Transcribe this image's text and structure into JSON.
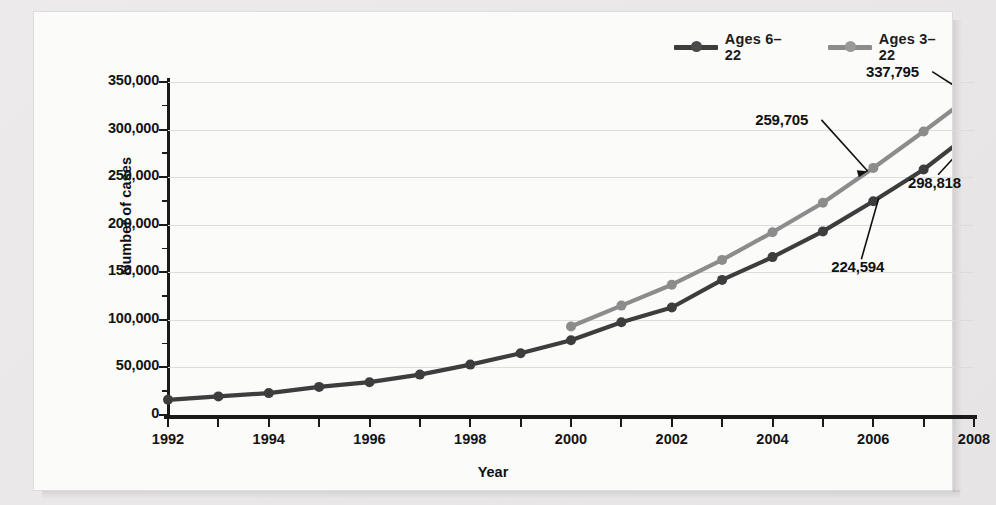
{
  "chart_data": {
    "type": "line",
    "title": "",
    "xlabel": "Year",
    "ylabel": "Number of cases",
    "xlim": [
      1992,
      2008
    ],
    "ylim": [
      0,
      350000
    ],
    "ytick_step": 50000,
    "yminor_step": 25000,
    "grid": "horizontal",
    "legend_position": "top-right",
    "x": [
      1992,
      1993,
      1994,
      1995,
      1996,
      1997,
      1998,
      1999,
      2000,
      2001,
      2002,
      2003,
      2004,
      2005,
      2006,
      2007,
      2008
    ],
    "xtick_labels": [
      "1992",
      "1994",
      "1996",
      "1998",
      "2000",
      "2002",
      "2004",
      "2006",
      "2008"
    ],
    "ytick_labels": [
      "0",
      "50,000",
      "100,000",
      "150,000",
      "200,000",
      "250,000",
      "300,000",
      "350,000"
    ],
    "series": [
      {
        "name": "Ages 6-22",
        "color": "#3d3d3d",
        "values": [
          16000,
          19500,
          23000,
          29500,
          34500,
          42500,
          53000,
          65000,
          78500,
          97500,
          113000,
          142000,
          166000,
          193000,
          224594,
          258000,
          298818
        ]
      },
      {
        "name": "Ages 3-22",
        "color": "#8c8c8c",
        "values": [
          null,
          null,
          null,
          null,
          null,
          null,
          null,
          null,
          93000,
          115000,
          137000,
          163000,
          192000,
          223000,
          259705,
          298000,
          337795
        ]
      }
    ],
    "annotations": [
      {
        "label": "337,795",
        "x": 2008,
        "y": 337795,
        "series": "Ages 3-22"
      },
      {
        "label": "259,705",
        "x": 2006,
        "y": 259705,
        "series": "Ages 3-22"
      },
      {
        "label": "298,818",
        "x": 2008,
        "y": 298818,
        "series": "Ages 6-22"
      },
      {
        "label": "224,594",
        "x": 2006,
        "y": 224594,
        "series": "Ages 6-22"
      }
    ]
  },
  "legend": {
    "items": [
      {
        "label": "Ages 6–22",
        "color": "#3d3d3d"
      },
      {
        "label": "Ages 3–22",
        "color": "#8c8c8c"
      }
    ]
  },
  "axes": {
    "y_title": "Number of cases",
    "x_title": "Year"
  }
}
